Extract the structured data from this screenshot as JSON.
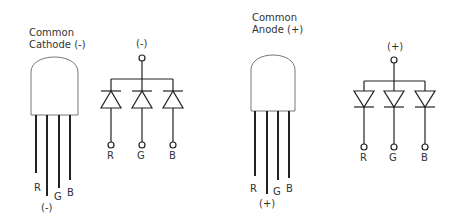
{
  "diagram": {
    "common_cathode": {
      "title_line1": "Common",
      "title_line2": "Cathode (-)",
      "package_pins": [
        "R",
        "(-)",
        "G",
        "B"
      ],
      "schematic": {
        "common_terminal": "(-)",
        "diode_orientation": "cathodes joined to common terminal",
        "outputs": [
          "R",
          "G",
          "B"
        ]
      }
    },
    "common_anode": {
      "title_line1": "Common",
      "title_line2": "Anode (+)",
      "package_pins": [
        "R",
        "(+)",
        "G",
        "B"
      ],
      "schematic": {
        "common_terminal": "(+)",
        "diode_orientation": "anodes joined to common terminal",
        "outputs": [
          "R",
          "G",
          "B"
        ]
      }
    },
    "colors": {
      "line": "#222222",
      "text": "#333333",
      "background": "#ffffff"
    }
  }
}
